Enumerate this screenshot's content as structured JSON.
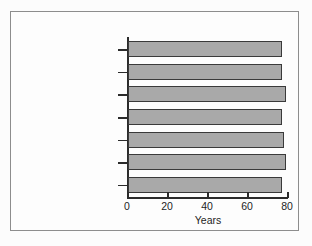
{
  "chart_data": {
    "type": "bar",
    "orientation": "horizontal",
    "title": "",
    "xlabel": "Years",
    "ylabel": "",
    "xlim": [
      0,
      80
    ],
    "xticks": [
      0,
      20,
      40,
      60,
      80
    ],
    "grid": false,
    "legend": null,
    "categories": [
      "United States",
      "Denmark",
      "France",
      "Germany",
      "Italy",
      "Sweden",
      "United Kingdom"
    ],
    "values": [
      77,
      77,
      79,
      77,
      78,
      79,
      77
    ],
    "bar_color": "#a9a9a9",
    "bar_edge_color": "#3a3a3a"
  },
  "figure": {
    "frame_color": "#8d8d8d",
    "background": "#fdfdfd",
    "axis_color": "#2b2b2b"
  }
}
